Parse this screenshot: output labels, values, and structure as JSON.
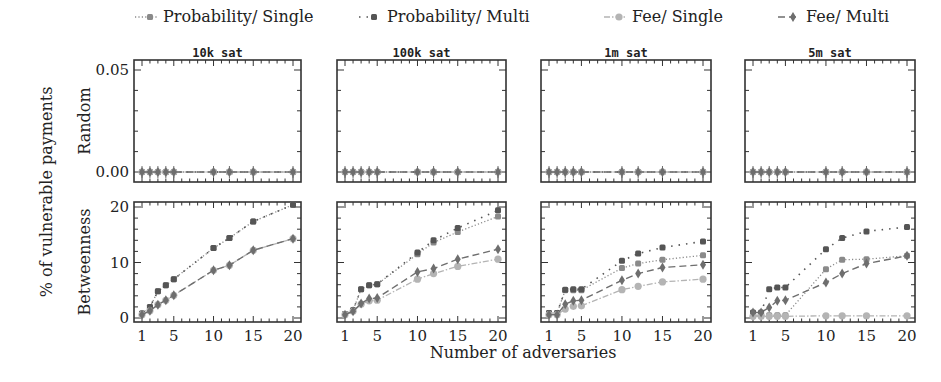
{
  "chart_data": {
    "type": "line",
    "title": "",
    "xlabel": "Number of adversaries",
    "ylabel": "% of vulnerable payments",
    "x": [
      1,
      2,
      3,
      4,
      5,
      10,
      12,
      15,
      20
    ],
    "xticks": [
      1,
      5,
      10,
      15,
      20
    ],
    "xlim": [
      0,
      21
    ],
    "legend": {
      "placement": "top",
      "entries": [
        {
          "name": "Probability/ Single",
          "style": "dotted",
          "marker": "square",
          "color": "#8a8a8a"
        },
        {
          "name": "Probability/ Multi",
          "style": "loosely-dotted",
          "marker": "square",
          "color": "#555555"
        },
        {
          "name": "Fee/ Single",
          "style": "dash-dot",
          "marker": "circle",
          "color": "#b4b4b4"
        },
        {
          "name": "Fee/ Multi",
          "style": "dashed",
          "marker": "diamond",
          "color": "#6e6e6e"
        }
      ]
    },
    "columns": [
      "10k sat",
      "100k sat",
      "1m sat",
      "5m sat"
    ],
    "rows": [
      {
        "label": "Random",
        "ylim": [
          0,
          0.05
        ],
        "yticks": [
          "0.00",
          "0.05"
        ],
        "ytick_values": [
          0,
          0.05
        ]
      },
      {
        "label": "Betweenness",
        "ylim": [
          0,
          21
        ],
        "yticks": [
          "0",
          "10",
          "20"
        ],
        "ytick_values": [
          0,
          10,
          20
        ]
      }
    ],
    "panels": [
      {
        "row": "Random",
        "column": "10k sat",
        "series": [
          {
            "name": "Probability/ Single",
            "values": [
              0,
              0,
              0,
              0,
              0,
              0,
              0,
              0,
              0
            ]
          },
          {
            "name": "Probability/ Multi",
            "values": [
              0,
              0,
              0,
              0,
              0,
              0,
              0,
              0,
              0
            ]
          },
          {
            "name": "Fee/ Single",
            "values": [
              0,
              0,
              0,
              0,
              0,
              0,
              0,
              0,
              0
            ]
          },
          {
            "name": "Fee/ Multi",
            "values": [
              0,
              0,
              0,
              0,
              0,
              0,
              0,
              0,
              0
            ]
          }
        ]
      },
      {
        "row": "Random",
        "column": "100k sat",
        "series": [
          {
            "name": "Probability/ Single",
            "values": [
              0,
              0,
              0,
              0,
              0,
              0,
              0,
              0,
              0
            ]
          },
          {
            "name": "Probability/ Multi",
            "values": [
              0,
              0,
              0,
              0,
              0,
              0,
              0,
              0,
              0
            ]
          },
          {
            "name": "Fee/ Single",
            "values": [
              0,
              0,
              0,
              0,
              0,
              0,
              0,
              0,
              0
            ]
          },
          {
            "name": "Fee/ Multi",
            "values": [
              0,
              0,
              0,
              0,
              0,
              0,
              0,
              0,
              0
            ]
          }
        ]
      },
      {
        "row": "Random",
        "column": "1m sat",
        "series": [
          {
            "name": "Probability/ Single",
            "values": [
              0,
              0,
              0,
              0,
              0,
              0,
              0,
              0,
              0
            ]
          },
          {
            "name": "Probability/ Multi",
            "values": [
              0,
              0,
              0,
              0,
              0,
              0,
              0,
              0,
              0
            ]
          },
          {
            "name": "Fee/ Single",
            "values": [
              0,
              0,
              0,
              0,
              0,
              0,
              0,
              0,
              0
            ]
          },
          {
            "name": "Fee/ Multi",
            "values": [
              0,
              0,
              0,
              0,
              0,
              0,
              0,
              0,
              0
            ]
          }
        ]
      },
      {
        "row": "Random",
        "column": "5m sat",
        "series": [
          {
            "name": "Probability/ Single",
            "values": [
              0,
              0,
              0,
              0,
              0,
              0,
              0,
              0,
              0
            ]
          },
          {
            "name": "Probability/ Multi",
            "values": [
              0,
              0,
              0,
              0,
              0,
              0,
              0,
              0,
              0
            ]
          },
          {
            "name": "Fee/ Single",
            "values": [
              0,
              0,
              0,
              0,
              0,
              0,
              0,
              0,
              0
            ]
          },
          {
            "name": "Fee/ Multi",
            "values": [
              0,
              0,
              0,
              0,
              0,
              0,
              0,
              0,
              0
            ]
          }
        ]
      },
      {
        "row": "Betweenness",
        "column": "10k sat",
        "series": [
          {
            "name": "Probability/ Single",
            "values": [
              0.8,
              2.0,
              4.8,
              5.9,
              7.0,
              12.6,
              14.4,
              17.4,
              20.4
            ]
          },
          {
            "name": "Probability/ Multi",
            "values": [
              0.8,
              2.0,
              4.8,
              5.9,
              7.0,
              12.6,
              14.4,
              17.4,
              20.4
            ]
          },
          {
            "name": "Fee/ Single",
            "values": [
              0.6,
              1.3,
              2.4,
              3.2,
              4.1,
              8.6,
              9.5,
              12.2,
              14.3
            ]
          },
          {
            "name": "Fee/ Multi",
            "values": [
              0.6,
              1.3,
              2.4,
              3.2,
              4.1,
              8.6,
              9.5,
              12.2,
              14.3
            ]
          }
        ]
      },
      {
        "row": "Betweenness",
        "column": "100k sat",
        "series": [
          {
            "name": "Probability/ Single",
            "values": [
              0.7,
              1.4,
              5.2,
              5.9,
              6.1,
              11.5,
              13.6,
              15.5,
              18.3
            ]
          },
          {
            "name": "Probability/ Multi",
            "values": [
              0.7,
              1.4,
              5.2,
              5.9,
              6.1,
              11.8,
              14.0,
              16.2,
              19.4
            ]
          },
          {
            "name": "Fee/ Single",
            "values": [
              0.6,
              1.2,
              2.5,
              3.1,
              3.2,
              7.0,
              8.0,
              9.3,
              10.6
            ]
          },
          {
            "name": "Fee/ Multi",
            "values": [
              0.6,
              1.2,
              2.6,
              3.5,
              3.6,
              8.3,
              8.9,
              10.6,
              12.4
            ]
          }
        ]
      },
      {
        "row": "Betweenness",
        "column": "1m sat",
        "series": [
          {
            "name": "Probability/ Single",
            "values": [
              0.9,
              0.9,
              5.0,
              5.0,
              5.0,
              9.0,
              9.8,
              10.5,
              11.3
            ]
          },
          {
            "name": "Probability/ Multi",
            "values": [
              0.9,
              0.9,
              5.1,
              5.2,
              5.2,
              10.3,
              11.6,
              12.7,
              13.8
            ]
          },
          {
            "name": "Fee/ Single",
            "values": [
              0.6,
              0.6,
              1.6,
              2.1,
              2.2,
              5.1,
              5.7,
              6.5,
              7.0
            ]
          },
          {
            "name": "Fee/ Multi",
            "values": [
              0.6,
              0.6,
              2.5,
              3.1,
              3.2,
              6.8,
              8.0,
              9.1,
              9.6
            ]
          }
        ]
      },
      {
        "row": "Betweenness",
        "column": "5m sat",
        "series": [
          {
            "name": "Probability/ Single",
            "values": [
              0.5,
              0.5,
              0.5,
              0.5,
              0.5,
              8.8,
              10.5,
              10.6,
              11.2
            ]
          },
          {
            "name": "Probability/ Multi",
            "values": [
              1.0,
              1.0,
              5.2,
              5.5,
              5.5,
              12.4,
              14.4,
              15.6,
              16.4
            ]
          },
          {
            "name": "Fee/ Single",
            "values": [
              0.3,
              0.3,
              0.3,
              0.3,
              0.3,
              0.4,
              0.4,
              0.4,
              0.4
            ]
          },
          {
            "name": "Fee/ Multi",
            "values": [
              1.0,
              1.0,
              1.9,
              3.1,
              3.2,
              6.4,
              8.0,
              9.8,
              11.2
            ]
          }
        ]
      }
    ]
  }
}
